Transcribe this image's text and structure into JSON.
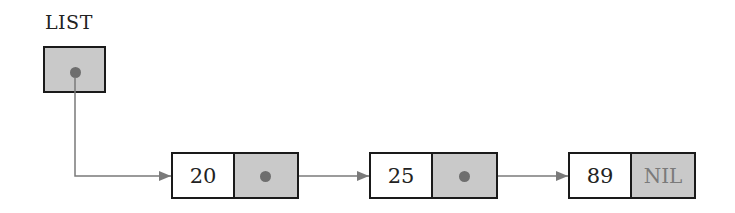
{
  "diagram": {
    "type": "singly-linked-list",
    "head": {
      "label": "LIST"
    },
    "nodes": [
      {
        "value": "20",
        "next": "pointer"
      },
      {
        "value": "25",
        "next": "pointer"
      },
      {
        "value": "89",
        "next": "NIL"
      }
    ],
    "nil_label": "NIL",
    "colors": {
      "pointer_cell": "#c9c9c9",
      "border": "#1a1a1a",
      "arrow": "#7a7a7a",
      "dot": "#6e6e6e",
      "nil_text": "#7a7a7a"
    }
  }
}
